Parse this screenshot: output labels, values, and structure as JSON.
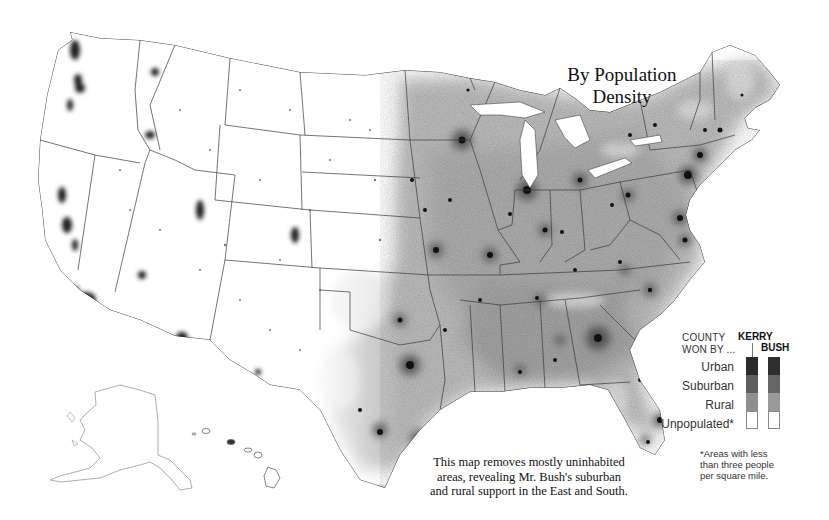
{
  "title": {
    "line1": "By Population",
    "line2": "Density"
  },
  "caption": {
    "line1": "This map removes mostly uninhabited",
    "line2": "areas, revealing Mr. Bush's suburban",
    "line3": "and rural support in the East and South."
  },
  "legend": {
    "heading_line1": "COUNTY",
    "heading_line2": "WON BY ...",
    "columns": [
      {
        "name": "KERRY",
        "colors": [
          "#2b2b2b",
          "#5e5e5e",
          "#8f8f8f",
          "#ffffff"
        ]
      },
      {
        "name": "BUSH",
        "colors": [
          "#2e2e2e",
          "#666666",
          "#9a9a9a",
          "#ffffff"
        ]
      }
    ],
    "rows": [
      "Urban",
      "Suburban",
      "Rural",
      "Unpopulated*"
    ]
  },
  "footnote": {
    "line1": "*Areas with less",
    "line2": "than three people",
    "line3": "per square mile."
  },
  "colors": {
    "background": "#ffffff",
    "border": "#444444",
    "urban": "#1a1a1a",
    "suburban": "#6a6a6a",
    "rural": "#b5b5b5",
    "unpopulated": "#ffffff"
  }
}
